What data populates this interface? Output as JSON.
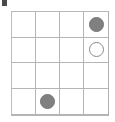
{
  "board": {
    "title": "4x4 grid board",
    "rows": 4,
    "columns": 4,
    "grid_line_color": "#b5b5b5",
    "border_color": "#b4b4b4",
    "background_color": "#ffffff",
    "filled_piece_color": "#808080",
    "open_piece_fill": "#ffffff",
    "open_piece_stroke": "#8a8a8a",
    "cells": [
      [
        {
          "state": "empty",
          "label": ""
        },
        {
          "state": "empty",
          "label": ""
        },
        {
          "state": "empty",
          "label": ""
        },
        {
          "state": "filled",
          "label": ""
        }
      ],
      [
        {
          "state": "empty",
          "label": ""
        },
        {
          "state": "empty",
          "label": ""
        },
        {
          "state": "empty",
          "label": ""
        },
        {
          "state": "open",
          "label": ""
        }
      ],
      [
        {
          "state": "empty",
          "label": ""
        },
        {
          "state": "empty",
          "label": ""
        },
        {
          "state": "empty",
          "label": ""
        },
        {
          "state": "empty",
          "label": ""
        }
      ],
      [
        {
          "state": "empty",
          "label": ""
        },
        {
          "state": "filled",
          "label": ""
        },
        {
          "state": "empty",
          "label": ""
        },
        {
          "state": "empty",
          "label": ""
        }
      ]
    ]
  },
  "artifact": {
    "name": "corner-mark",
    "color": "#4a4a4a"
  }
}
